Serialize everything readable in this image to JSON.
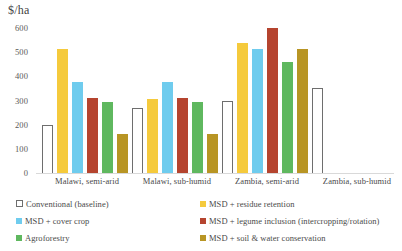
{
  "chart_data": {
    "type": "bar",
    "title": "",
    "ylabel": "$/ha",
    "xlabel": "",
    "ylim": [
      0,
      600
    ],
    "yticks": [
      0,
      100,
      200,
      300,
      400,
      500,
      600
    ],
    "grid": false,
    "legend_position": "bottom",
    "categories": [
      "Malawi, semi-arid",
      "Malawi, sub-humid",
      "Zambia, semi-arid",
      "Zambia, sub-humid"
    ],
    "series": [
      {
        "name": "Conventional (baseline)",
        "color": "#FFFFFF",
        "border": "#6E6E6E",
        "values": [
          200,
          270,
          297,
          352
        ]
      },
      {
        "name": "MSD + residue retention",
        "color": "#F5CA3C",
        "values": [
          512,
          305,
          537,
          null
        ]
      },
      {
        "name": "MSD + cover crop",
        "color": "#6FCCEE",
        "values": [
          378,
          377,
          515,
          null
        ]
      },
      {
        "name": "MSD + legume inclusion (intercropping/rotation)",
        "color": "#B5442F",
        "values": [
          311,
          312,
          602,
          null
        ]
      },
      {
        "name": "Agroforestry",
        "color": "#5FB85F",
        "values": [
          292,
          292,
          460,
          null
        ]
      },
      {
        "name": "MSD + soil & water conservation",
        "color": "#B89524",
        "values": [
          162,
          163,
          514,
          null
        ]
      }
    ]
  },
  "legend": {
    "items": [
      {
        "label": "Conventional (baseline)",
        "color": "#FFFFFF",
        "style": "hollow"
      },
      {
        "label": "MSD + residue retention",
        "color": "#F5CA3C",
        "style": "solid"
      },
      {
        "label": "MSD + cover crop",
        "color": "#6FCCEE",
        "style": "solid"
      },
      {
        "label": "MSD + legume inclusion (intercropping/rotation)",
        "color": "#B5442F",
        "style": "solid"
      },
      {
        "label": "Agroforestry",
        "color": "#5FB85F",
        "style": "solid"
      },
      {
        "label": "MSD + soil & water conservation",
        "color": "#B89524",
        "style": "solid"
      }
    ]
  }
}
